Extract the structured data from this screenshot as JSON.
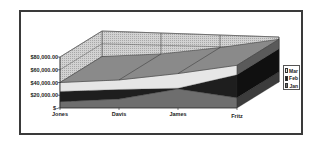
{
  "chart_data": {
    "type": "area",
    "subtype": "3d-stacked-area",
    "title": "",
    "xlabel": "",
    "ylabel": "",
    "categories": [
      "Jones",
      "Davis",
      "James",
      "Fritz"
    ],
    "series": [
      {
        "name": "Jan",
        "values": [
          10000,
          14000,
          30000,
          16000
        ],
        "color": "#6e6e6e"
      },
      {
        "name": "Feb",
        "values": [
          16000,
          15000,
          1000,
          36000
        ],
        "color": "#1e1e1e"
      },
      {
        "name": "Mar",
        "values": [
          14000,
          15000,
          23000,
          15000
        ],
        "color": "#e6e6e6"
      }
    ],
    "yticks": [
      "$80,000.00",
      "$60,000.00",
      "$40,000.00",
      "$20,000.00",
      "$-"
    ],
    "ylim": [
      0,
      80000
    ],
    "grid": true,
    "legend": {
      "position": "right",
      "entries": [
        "Mar",
        "Feb",
        "Jan"
      ]
    }
  },
  "axis": {
    "y_labels": [
      "$80,000.00",
      "$60,000.00",
      "$40,000.00",
      "$20,000.00",
      "$-"
    ],
    "x_labels": [
      "Jones",
      "Davis",
      "James",
      "Fritz"
    ]
  },
  "legend": {
    "items": [
      {
        "label": "Mar",
        "color": "#e6e6e6"
      },
      {
        "label": "Feb",
        "color": "#1e1e1e"
      },
      {
        "label": "Jan",
        "color": "#6e6e6e"
      }
    ]
  }
}
